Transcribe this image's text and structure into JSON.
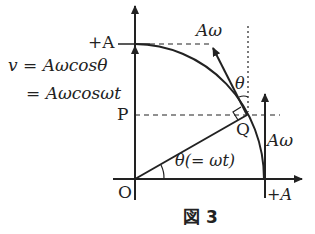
{
  "diagram": {
    "labels": {
      "plus_a_top": "+A",
      "plus_a_right": "+A",
      "velocity_eq1": "v = Aωcosθ",
      "velocity_eq2": "= Aωcosωt",
      "point_p": "P",
      "point_q": "Q",
      "origin": "O",
      "a_omega_top": "Aω",
      "a_omega_right": "Aω",
      "theta_top": "θ",
      "theta_angle": "θ(= ωt)"
    },
    "caption": "図 3",
    "colors": {
      "line": "#222222",
      "background": "#ffffff"
    }
  }
}
